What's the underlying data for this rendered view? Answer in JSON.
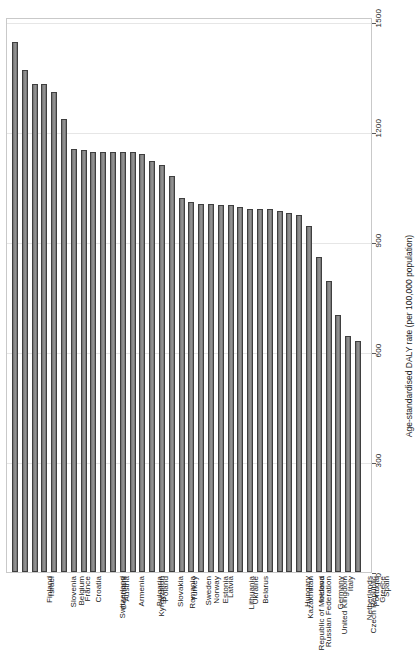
{
  "chart": {
    "type": "bar",
    "title": "",
    "subtitle": "",
    "xlabel": "",
    "ylabel": "Age-standardised DALY rate (per 100,000 population)",
    "ylim": [
      0,
      1560
    ],
    "yticks": [
      0,
      300,
      600,
      900,
      1200,
      1500
    ],
    "ytick_labels": [
      "0",
      "300",
      "600",
      "900",
      "1200",
      "1500"
    ],
    "grid": "horizontal",
    "legend": "none",
    "bar_fill": "#8a8a8a",
    "bar_border": "#3f3f3f",
    "panel_border": "#c9c9c9",
    "gridline_color": "#e6e6e6"
  },
  "chart_data": {
    "type": "bar",
    "title": "",
    "xlabel": "",
    "ylabel": "Age-standardised DALY rate (per 100,000 population)",
    "ylim": [
      0,
      1560
    ],
    "yticks": [
      0,
      300,
      600,
      900,
      1200,
      1500
    ],
    "grid": true,
    "legend_position": "none",
    "categories": [
      "Finland",
      "Israel",
      "Slovenia",
      "Belgium",
      "France",
      "Croatia",
      "Switzerland",
      "Denmark",
      "Austria",
      "Armenia",
      "Kyrgyzstan",
      "Bulgaria",
      "Poland",
      "Slovakia",
      "Romania",
      "Turkey",
      "Sweden",
      "Norway",
      "Estonia",
      "Latvia",
      "Lithuania",
      "Ukraine",
      "Belarus",
      "Republic of Moldova",
      "Russian Federation",
      "Kazakhstan",
      "Hungary",
      "United Kingdom",
      "Ireland",
      "Germany",
      "Czech Republic",
      "Netherlands",
      "Italy",
      "Portugal",
      "Greece",
      "Spain"
    ],
    "values": [
      1445,
      1370,
      1330,
      1330,
      1310,
      1235,
      1155,
      1150,
      1145,
      1145,
      1145,
      1145,
      1145,
      1140,
      1120,
      1110,
      1080,
      1020,
      1010,
      1005,
      1005,
      1000,
      1000,
      995,
      990,
      990,
      990,
      985,
      980,
      975,
      945,
      860,
      795,
      700,
      645,
      630
    ]
  }
}
